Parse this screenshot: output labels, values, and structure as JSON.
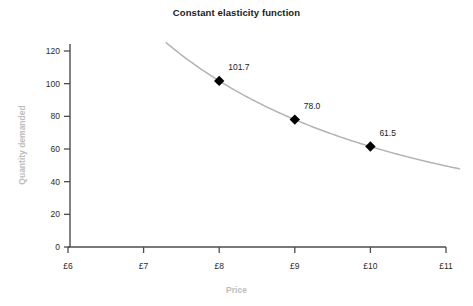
{
  "chart_data": {
    "type": "line",
    "title": "Constant elasticity function",
    "xlabel": "Price",
    "ylabel": "Quantity demanded",
    "xlim": [
      6,
      11
    ],
    "ylim": [
      0,
      130
    ],
    "grid": false,
    "legend": "none",
    "x_tick_labels": [
      "£6",
      "£7",
      "£8",
      "£9",
      "£10",
      "£11"
    ],
    "x_tick_values": [
      6,
      7,
      8,
      9,
      10,
      11
    ],
    "y_tick_labels": [
      "0",
      "20",
      "40",
      "60",
      "80",
      "100",
      "120"
    ],
    "y_tick_values": [
      0,
      20,
      40,
      60,
      80,
      100,
      120
    ],
    "series": [
      {
        "name": "Constant elasticity demand curve",
        "type": "line",
        "color": "#b3b3b3",
        "x": [
          7.3,
          7.5,
          7.75,
          8.0,
          8.25,
          8.5,
          8.75,
          9.0,
          9.25,
          9.5,
          9.75,
          10.0,
          10.25,
          10.5,
          10.75,
          11.0,
          11.15
        ],
        "y": [
          125.0,
          118.4,
          110.8,
          101.7,
          96.9,
          91.3,
          86.3,
          78.0,
          77.4,
          73.6,
          70.2,
          61.5,
          64.2,
          61.5,
          59.1,
          56.8,
          55.5
        ]
      },
      {
        "name": "Marked observations",
        "type": "scatter",
        "color": "#000000",
        "marker": "diamond",
        "x": [
          8,
          9,
          10
        ],
        "y": [
          101.7,
          78.0,
          61.5
        ],
        "labels": [
          "101.7",
          "78.0",
          "61.5"
        ]
      }
    ],
    "annotations": [
      {
        "text": "101.7",
        "x": 8,
        "y": 101.7
      },
      {
        "text": "78.0",
        "x": 9,
        "y": 78.0
      },
      {
        "text": "61.5",
        "x": 10,
        "y": 61.5
      }
    ],
    "colors": {
      "curve": "#b3b3b3",
      "marker": "#000000",
      "axis": "#4d4d4d",
      "tick_text": "#2b2b2b",
      "axis_label_text": "#bdbdbd",
      "title_text": "#1a1a1a",
      "background": "#ffffff"
    }
  }
}
